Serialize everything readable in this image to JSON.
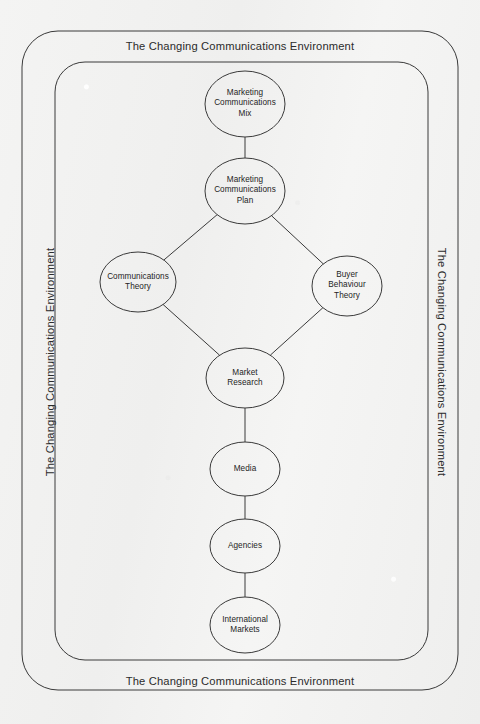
{
  "page": {
    "background_color": "#f2f2f1",
    "stroke_color": "#3a3a3a",
    "text_color": "#2a2a2a"
  },
  "environment_frame": {
    "label": "The Changing Communications Environment",
    "positions": [
      "top",
      "bottom",
      "left",
      "right"
    ],
    "outer_border": {
      "x": 22,
      "y": 31,
      "width": 436,
      "height": 659,
      "radius": 36
    },
    "inner_border": {
      "x": 55,
      "y": 62,
      "width": 373,
      "height": 598,
      "radius": 30
    }
  },
  "diagram": {
    "type": "flowchart",
    "title": "The Changing Communications Environment",
    "nodes": [
      {
        "id": "marketing-communications-mix",
        "label": "Marketing\nCommunications\nMix",
        "cx": 245,
        "cy": 104,
        "rx": 40,
        "ry": 33
      },
      {
        "id": "marketing-communications-plan",
        "label": "Marketing\nCommunications\nPlan",
        "cx": 245,
        "cy": 191,
        "rx": 40,
        "ry": 33
      },
      {
        "id": "communications-theory",
        "label": "Communications\nTheory",
        "cx": 138,
        "cy": 282,
        "rx": 38,
        "ry": 30
      },
      {
        "id": "buyer-behaviour-theory",
        "label": "Buyer\nBehaviour\nTheory",
        "cx": 347,
        "cy": 286,
        "rx": 35,
        "ry": 30
      },
      {
        "id": "market-research",
        "label": "Market\nResearch",
        "cx": 245,
        "cy": 378,
        "rx": 39,
        "ry": 30
      },
      {
        "id": "media",
        "label": "Media",
        "cx": 245,
        "cy": 469,
        "rx": 35,
        "ry": 27
      },
      {
        "id": "agencies",
        "label": "Agencies",
        "cx": 245,
        "cy": 546,
        "rx": 35,
        "ry": 27
      },
      {
        "id": "international-markets",
        "label": "International\nMarkets",
        "cx": 245,
        "cy": 625,
        "rx": 35,
        "ry": 28
      }
    ],
    "edges": [
      {
        "from": "marketing-communications-mix",
        "to": "marketing-communications-plan"
      },
      {
        "from": "marketing-communications-plan",
        "to": "communications-theory"
      },
      {
        "from": "marketing-communications-plan",
        "to": "buyer-behaviour-theory"
      },
      {
        "from": "communications-theory",
        "to": "market-research"
      },
      {
        "from": "buyer-behaviour-theory",
        "to": "market-research"
      },
      {
        "from": "market-research",
        "to": "media"
      },
      {
        "from": "media",
        "to": "agencies"
      },
      {
        "from": "agencies",
        "to": "international-markets"
      }
    ]
  }
}
